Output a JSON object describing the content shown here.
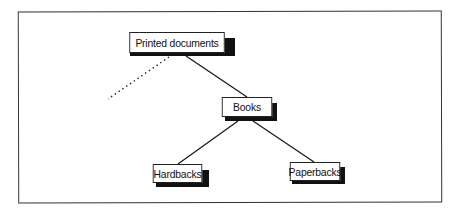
{
  "diagram": {
    "type": "tree",
    "nodes": [
      {
        "id": "root",
        "label": "Printed documents"
      },
      {
        "id": "books",
        "label": "Books"
      },
      {
        "id": "hardbacks",
        "label": "Hardbacks"
      },
      {
        "id": "paperbacks",
        "label": "Paperbacks"
      }
    ],
    "edges": [
      {
        "from": "root",
        "to": "books",
        "style": "solid"
      },
      {
        "from": "books",
        "to": "hardbacks",
        "style": "solid"
      },
      {
        "from": "books",
        "to": "paperbacks",
        "style": "solid"
      },
      {
        "from": "root",
        "to": "(elided sibling)",
        "style": "dotted"
      }
    ],
    "colors": {
      "line": "#1a1a1a",
      "shadow": "#111111",
      "box_fill": "#ffffff"
    }
  }
}
